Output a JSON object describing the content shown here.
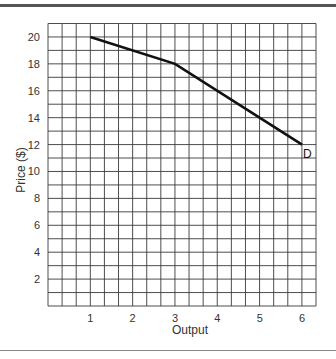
{
  "chart_data": {
    "type": "line",
    "title": "",
    "xlabel": "Output",
    "ylabel": "Price ($)",
    "xlim": [
      0,
      6.33
    ],
    "ylim": [
      0,
      21
    ],
    "grid": true,
    "x_ticks": [
      1,
      2,
      3,
      4,
      5,
      6
    ],
    "y_ticks": [
      2,
      4,
      6,
      8,
      10,
      12,
      14,
      16,
      18,
      20
    ],
    "series": [
      {
        "name": "D",
        "x": [
          1,
          3,
          6
        ],
        "y": [
          20,
          18,
          12
        ]
      }
    ],
    "annotations": [
      {
        "text": "D",
        "x": 6,
        "y": 12
      }
    ]
  },
  "labels": {
    "xlabel": "Output",
    "ylabel": "Price ($)",
    "series_label": "D"
  },
  "colors": {
    "grid": "#3a3a3a",
    "line": "#111111",
    "frame_top": "#555555",
    "frame_bottom": "#8a8a8a"
  }
}
